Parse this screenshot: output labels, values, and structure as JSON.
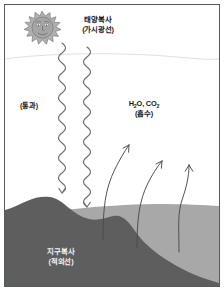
{
  "figure": {
    "width": 224,
    "height": 291
  },
  "labels": {
    "solar_radiation": {
      "line1": "태양복사",
      "line2": "(가시광선)"
    },
    "transmission": {
      "line1": "(통과)"
    },
    "greenhouse_gases": {
      "formula_h2o": "H",
      "formula_h2o_sub": "2",
      "formula_h2o_tail": "O, CO",
      "formula_co2_sub": "2",
      "line2": "(흡수)"
    },
    "earth_radiation": {
      "line1": "지구복사",
      "line2": "(적외선)"
    }
  },
  "icons": {
    "sun": "sun-with-face-icon",
    "downward_wave_left": "wavy-downward-ray-icon",
    "downward_wave_right": "wavy-downward-ray-icon",
    "upward_arrow_1": "curved-upward-arrow-icon",
    "upward_arrow_2": "curved-upward-arrow-icon",
    "upward_arrow_3": "curved-upward-arrow-icon"
  },
  "colors": {
    "border": "#555a5c",
    "sky": "#ffffff",
    "ground_light": "#a8a8a8",
    "hill_dark": "#5e5e5e",
    "ray_stroke": "#6b6b6b",
    "arrow_stroke": "#4a4a4a",
    "sun_fill": "#a5a5a5",
    "sun_stroke": "#6f6f6f",
    "atmosphere_line": "#d8d8d8",
    "text_dark": "#1b1b1b",
    "text_light": "#f2f2f2"
  }
}
